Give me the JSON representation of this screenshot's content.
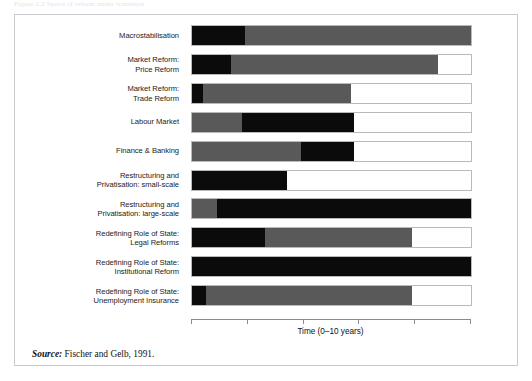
{
  "top_caption": "Figure 2.2  Speed of reform under transition",
  "axis": {
    "title": "Time (0–10 years)",
    "range_min": 0,
    "range_max": 10,
    "ticks": [
      0,
      2,
      4,
      6,
      8,
      10
    ]
  },
  "source": {
    "prefix": "Source:",
    "text": " Fischer and Gelb, 1991."
  },
  "colors": {
    "phase_black": "#0b0b0b",
    "phase_gray": "#595959",
    "phase_white": "#ffffff",
    "bar_border": "#b9b9bf",
    "frame_border": "#c9c9cf",
    "axis": "#8a8a90"
  },
  "chart_data": {
    "type": "bar",
    "orientation": "horizontal",
    "stacked": true,
    "title": "",
    "xlabel": "Time (0–10 years)",
    "ylabel": "",
    "xlim": [
      0,
      10
    ],
    "grid": false,
    "legend": "none",
    "phase_keys": [
      "black",
      "gray",
      "white"
    ],
    "categories": [
      "Macrostabilisation",
      "Market Reform:\nPrice Reform",
      "Market Reform:\nTrade Reform",
      "Labour Market",
      "Finance & Banking",
      "Restructuring and\nPrivatisation: small-scale",
      "Restructuring and\nPrivatisation: large-scale",
      "Redefining Role of State:\nLegal Reforms",
      "Redefining Role of State:\nInstitutional Reform",
      "Redefining Role of State:\nUnemployment Insurance"
    ],
    "rows": [
      {
        "label": "Macrostabilisation",
        "segments": [
          {
            "phase": "black",
            "start": 0.0,
            "end": 1.9
          },
          {
            "phase": "gray",
            "start": 1.9,
            "end": 10.0
          }
        ]
      },
      {
        "label": "Market Reform:\nPrice Reform",
        "segments": [
          {
            "phase": "black",
            "start": 0.0,
            "end": 1.4
          },
          {
            "phase": "gray",
            "start": 1.4,
            "end": 8.8
          },
          {
            "phase": "white",
            "start": 8.8,
            "end": 10.0
          }
        ]
      },
      {
        "label": "Market Reform:\nTrade Reform",
        "segments": [
          {
            "phase": "black",
            "start": 0.0,
            "end": 0.4
          },
          {
            "phase": "gray",
            "start": 0.4,
            "end": 5.7
          },
          {
            "phase": "white",
            "start": 5.7,
            "end": 10.0
          }
        ]
      },
      {
        "label": "Labour Market",
        "segments": [
          {
            "phase": "gray",
            "start": 0.0,
            "end": 1.8
          },
          {
            "phase": "black",
            "start": 1.8,
            "end": 5.8
          },
          {
            "phase": "white",
            "start": 5.8,
            "end": 10.0
          }
        ]
      },
      {
        "label": "Finance & Banking",
        "segments": [
          {
            "phase": "gray",
            "start": 0.0,
            "end": 3.9
          },
          {
            "phase": "black",
            "start": 3.9,
            "end": 5.8
          },
          {
            "phase": "white",
            "start": 5.8,
            "end": 10.0
          }
        ]
      },
      {
        "label": "Restructuring and\nPrivatisation: small-scale",
        "segments": [
          {
            "phase": "black",
            "start": 0.0,
            "end": 3.4
          },
          {
            "phase": "white",
            "start": 3.4,
            "end": 10.0
          }
        ]
      },
      {
        "label": "Restructuring and\nPrivatisation: large-scale",
        "segments": [
          {
            "phase": "gray",
            "start": 0.0,
            "end": 0.9
          },
          {
            "phase": "black",
            "start": 0.9,
            "end": 10.0
          }
        ]
      },
      {
        "label": "Redefining Role of State:\nLegal Reforms",
        "segments": [
          {
            "phase": "black",
            "start": 0.0,
            "end": 2.6
          },
          {
            "phase": "gray",
            "start": 2.6,
            "end": 7.9
          },
          {
            "phase": "white",
            "start": 7.9,
            "end": 10.0
          }
        ]
      },
      {
        "label": "Redefining Role of State:\nInstitutional Reform",
        "segments": [
          {
            "phase": "black",
            "start": 0.0,
            "end": 10.0
          }
        ]
      },
      {
        "label": "Redefining Role of State:\nUnemployment Insurance",
        "segments": [
          {
            "phase": "black",
            "start": 0.0,
            "end": 0.5
          },
          {
            "phase": "gray",
            "start": 0.5,
            "end": 7.9
          },
          {
            "phase": "white",
            "start": 7.9,
            "end": 10.0
          }
        ]
      }
    ]
  }
}
